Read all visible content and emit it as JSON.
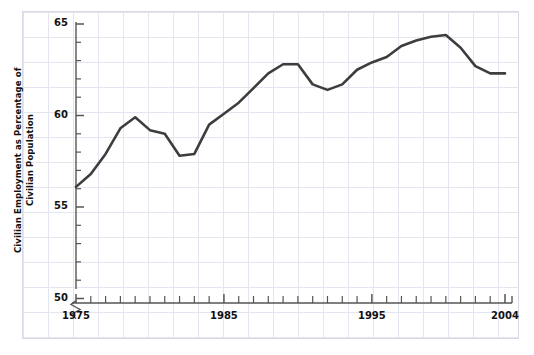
{
  "chart_data": {
    "type": "line",
    "title": "",
    "subtitle": "",
    "xlabel": "",
    "ylabel": "Civilian Employment as Percentage of Civilian Population",
    "ylabel_line1": "Civilian Employment as Percentage",
    "ylabel_line2": "of Civilian Population",
    "xlim": [
      1975,
      2004
    ],
    "ylim": [
      50,
      65
    ],
    "y_axis_break": true,
    "y_axis_break_note": "axis broken between 0 and 50",
    "grid": true,
    "legend": false,
    "legend_position": "none",
    "y_tick_labels": [
      "50",
      "55",
      "60",
      "65"
    ],
    "y_tick_values": [
      50,
      55,
      60,
      65
    ],
    "y_minor_tick_step": 1,
    "x_tick_labels": [
      "1975",
      "1985",
      "1995",
      "2004"
    ],
    "x_tick_values": [
      1975,
      1985,
      1995,
      2004
    ],
    "x_minor_tick_step": 1,
    "line_color": "#3d3d3d",
    "line_width": 2.6,
    "grid_color": "#e3e6ef",
    "axis_color": "#555555",
    "text_color": "#111111",
    "background_color": "#ffffff",
    "x": [
      1975,
      1976,
      1977,
      1978,
      1979,
      1980,
      1981,
      1982,
      1983,
      1984,
      1985,
      1986,
      1987,
      1988,
      1989,
      1990,
      1991,
      1992,
      1993,
      1994,
      1995,
      1996,
      1997,
      1998,
      1999,
      2000,
      2001,
      2002,
      2003,
      2004
    ],
    "values": [
      56.1,
      56.8,
      57.9,
      59.3,
      59.9,
      59.2,
      59.0,
      57.8,
      57.9,
      59.5,
      60.1,
      60.7,
      61.5,
      62.3,
      62.8,
      62.8,
      61.7,
      61.4,
      61.7,
      62.5,
      62.9,
      63.2,
      63.8,
      64.1,
      64.3,
      64.4,
      63.7,
      62.7,
      62.3,
      62.3
    ],
    "series": [
      {
        "name": "Civilian employment ratio",
        "values": [
          56.1,
          56.8,
          57.9,
          59.3,
          59.9,
          59.2,
          59.0,
          57.8,
          57.9,
          59.5,
          60.1,
          60.7,
          61.5,
          62.3,
          62.8,
          62.8,
          61.7,
          61.4,
          61.7,
          62.5,
          62.9,
          63.2,
          63.8,
          64.1,
          64.3,
          64.4,
          63.7,
          62.7,
          62.3,
          62.3
        ]
      }
    ]
  }
}
